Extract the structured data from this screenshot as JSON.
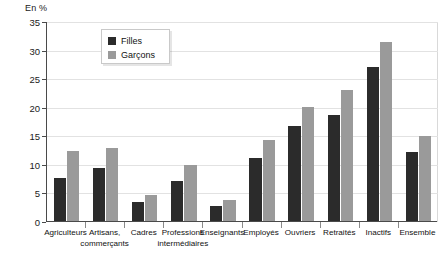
{
  "chart_data": {
    "type": "bar",
    "title": "",
    "subtitle": "",
    "xlabel": "",
    "ylabel": "En %",
    "unit_label": "En %",
    "ylim": [
      0,
      35
    ],
    "ytick_step": 5,
    "yticks": [
      0,
      5,
      10,
      15,
      20,
      25,
      30,
      35
    ],
    "ytick_labels": [
      "0",
      "5",
      "10",
      "15",
      "20",
      "25",
      "30",
      "35"
    ],
    "grid": true,
    "legend_position": "top-center-left",
    "categories": [
      "Agriculteurs",
      "Artisans, commerçants",
      "Cadres",
      "Professions intermédiaires",
      "Enseignants",
      "Employés",
      "Ouvriers",
      "Retraités",
      "Inactifs",
      "Ensemble"
    ],
    "category_lines": [
      [
        "Agriculteurs"
      ],
      [
        "Artisans,",
        "commerçants"
      ],
      [
        "Cadres"
      ],
      [
        "Professions",
        "intermédiaires"
      ],
      [
        "Enseignants"
      ],
      [
        "Employés"
      ],
      [
        "Ouvriers"
      ],
      [
        "Retraités"
      ],
      [
        "Inactifs"
      ],
      [
        "Ensemble"
      ]
    ],
    "series": [
      {
        "name": "Filles",
        "color": "#2b2b2b",
        "values": [
          7.5,
          9.3,
          3.3,
          7.0,
          2.6,
          11.0,
          16.7,
          18.5,
          27.0,
          12.0
        ]
      },
      {
        "name": "Garçons",
        "color": "#9a9a9a",
        "values": [
          12.3,
          12.7,
          4.6,
          9.8,
          3.6,
          14.1,
          20.0,
          22.9,
          31.4,
          14.9
        ]
      }
    ]
  },
  "legend": {
    "items": [
      {
        "label": "Filles",
        "color": "#2b2b2b"
      },
      {
        "label": "Garçons",
        "color": "#9a9a9a"
      }
    ]
  },
  "colors": {
    "filles": "#2b2b2b",
    "garcons": "#9a9a9a",
    "axis": "#4a4a4a",
    "grid": "#e2e2e2",
    "background": "#ffffff"
  }
}
